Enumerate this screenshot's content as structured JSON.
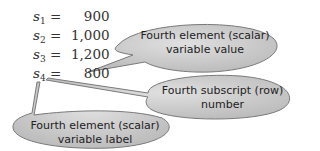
{
  "equations": [
    {
      "var": "s",
      "sub": "1",
      "eq": "=",
      "value": "900"
    },
    {
      "var": "s",
      "sub": "2",
      "eq": "=",
      "value": "1,000"
    },
    {
      "var": "s",
      "sub": "3",
      "eq": "=",
      "value": "1,200"
    },
    {
      "var": "s",
      "sub": "4",
      "eq": "=",
      "value": "800"
    }
  ],
  "callouts": {
    "value": {
      "line1": "Fourth element (scalar)",
      "line2": "variable value"
    },
    "subscript": {
      "line1": "Fourth subscript (row)",
      "line2": "number"
    },
    "label": {
      "line1": "Fourth element (scalar)",
      "line2": "variable label"
    }
  },
  "colors": {
    "bubble_fill": "#c8c8c8",
    "bubble_stroke": "#7a7a7a",
    "text": "#222222"
  }
}
